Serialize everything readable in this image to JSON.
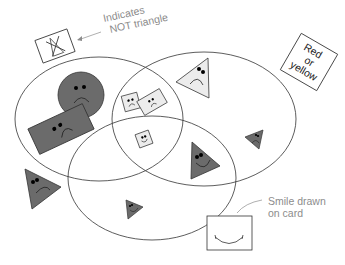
{
  "annotations": {
    "not_triangle": {
      "line1": "Indicates",
      "line2": "NOT triangle"
    },
    "smile_card": {
      "line1": "Smile drawn",
      "line2": "on card"
    },
    "red_or_yellow_card": {
      "line1": "Red",
      "line2": "or",
      "line3": "yellow"
    }
  },
  "colors": {
    "dark_fill": "#6b6b6b",
    "light_fill": "#ececec",
    "outline": "#333333",
    "annotation_text": "#8c8c8c"
  },
  "legend_cards": [
    {
      "name": "not-triangle-card",
      "meaning": "Indicates NOT triangle",
      "glyph": "crossed-out triangle"
    },
    {
      "name": "red-or-yellow-card",
      "meaning": "Red or yellow"
    },
    {
      "name": "smile-card",
      "meaning": "Smile drawn on card"
    }
  ],
  "regions": [
    {
      "name": "not-triangle-set",
      "ellipse": "left"
    },
    {
      "name": "red-or-yellow-set",
      "ellipse": "right"
    },
    {
      "name": "smile-set",
      "ellipse": "bottom"
    }
  ],
  "shapes": [
    {
      "shape": "circle",
      "color": "dark",
      "face": "frown",
      "region": "left only"
    },
    {
      "shape": "rectangle",
      "color": "dark",
      "face": "frown",
      "region": "left only"
    },
    {
      "shape": "square",
      "color": "light",
      "face": "frown",
      "region": "left and right"
    },
    {
      "shape": "rectangle",
      "color": "light",
      "face": "frown",
      "region": "left and right"
    },
    {
      "shape": "square",
      "color": "light",
      "face": "smile",
      "region": "left, right and bottom"
    },
    {
      "shape": "triangle",
      "color": "light",
      "face": "frown",
      "region": "right only"
    },
    {
      "shape": "triangle",
      "color": "dark",
      "face": "frown",
      "region": "right only",
      "size": "small"
    },
    {
      "shape": "triangle",
      "color": "dark",
      "face": "smile",
      "region": "right and bottom"
    },
    {
      "shape": "triangle",
      "color": "dark",
      "face": "smile",
      "region": "bottom only",
      "size": "small"
    },
    {
      "shape": "triangle",
      "color": "dark",
      "face": "frown",
      "region": "outside all"
    }
  ]
}
